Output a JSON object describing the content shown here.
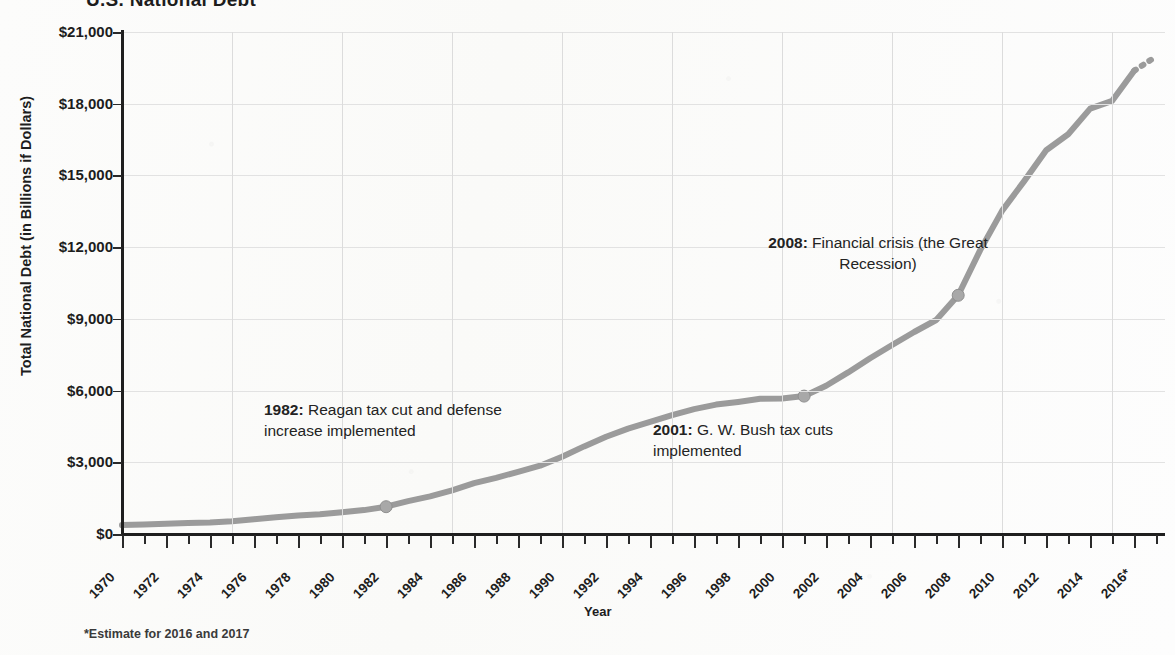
{
  "chart_data": {
    "type": "line",
    "title": "U.S. National Debt",
    "xlabel": "Year",
    "ylabel": "Total National Debt (in Billions if Dollars)",
    "ylim": [
      0,
      21000
    ],
    "xlim": [
      1970,
      2017
    ],
    "grid": true,
    "legend": "none",
    "ytick_labels": [
      "$21,000",
      "$18,000",
      "$15,000",
      "$12,000",
      "$9,000",
      "$6,000",
      "$3,000",
      "$0"
    ],
    "ytick_values": [
      21000,
      18000,
      15000,
      12000,
      9000,
      6000,
      3000,
      0
    ],
    "xtick_labels": [
      "1970",
      "1972",
      "1974",
      "1976",
      "1978",
      "1980",
      "1982",
      "1984",
      "1986",
      "1988",
      "1990",
      "1992",
      "1994",
      "1996",
      "1998",
      "2000",
      "2002",
      "2004",
      "2006",
      "2008",
      "2010",
      "2012",
      "2014",
      "2016*"
    ],
    "x": [
      1970,
      1971,
      1972,
      1973,
      1974,
      1975,
      1976,
      1977,
      1978,
      1979,
      1980,
      1981,
      1982,
      1983,
      1984,
      1985,
      1986,
      1987,
      1988,
      1989,
      1990,
      1991,
      1992,
      1993,
      1994,
      1995,
      1996,
      1997,
      1998,
      1999,
      2000,
      2001,
      2002,
      2003,
      2004,
      2005,
      2006,
      2007,
      2008,
      2009,
      2010,
      2011,
      2012,
      2013,
      2014,
      2015,
      2016,
      2017
    ],
    "values": [
      371,
      398,
      427,
      458,
      475,
      533,
      620,
      699,
      772,
      827,
      908,
      998,
      1142,
      1377,
      1572,
      1823,
      2125,
      2350,
      2602,
      2857,
      3233,
      3665,
      4065,
      4411,
      4693,
      4974,
      5225,
      5413,
      5526,
      5656,
      5674,
      5770,
      6198,
      6760,
      7355,
      7905,
      8451,
      8951,
      9986,
      11876,
      13529,
      14764,
      16051,
      16719,
      17794,
      18120,
      19380,
      19980
    ],
    "series_color": "#9b9b9b",
    "estimate_dashed_from": 2016,
    "markers": [
      {
        "year": 1982,
        "value": 1142
      },
      {
        "year": 2001,
        "value": 5770
      },
      {
        "year": 2008,
        "value": 9986
      }
    ],
    "annotations": [
      {
        "id": "ann-1982",
        "year_label": "1982:",
        "text": " Reagan tax cut and defense increase implemented"
      },
      {
        "id": "ann-2001",
        "year_label": "2001:",
        "text": " G. W. Bush tax cuts implemented"
      },
      {
        "id": "ann-2008",
        "year_label": "2008:",
        "text": " Financial crisis (the Great Recession)"
      }
    ],
    "footnote": "*Estimate for 2016 and 2017"
  }
}
